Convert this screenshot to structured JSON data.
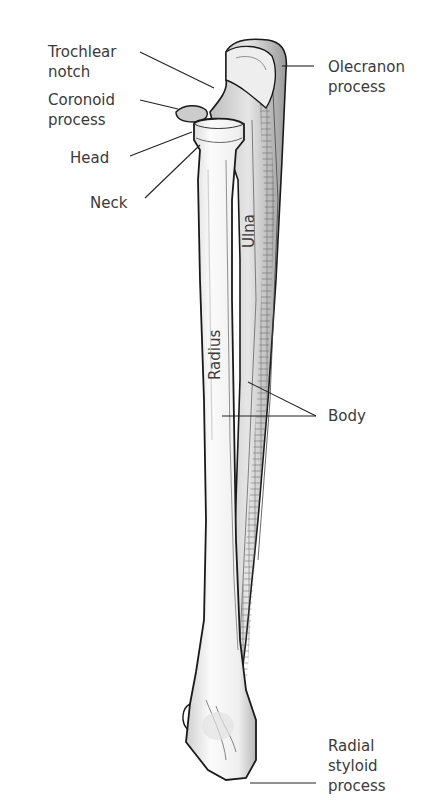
{
  "diagram": {
    "bone_labels": {
      "radius": "Radius",
      "ulna": "Ulna"
    },
    "callouts": [
      {
        "id": "trochlear-notch",
        "text": "Trochlear\nnotch"
      },
      {
        "id": "coronoid-process",
        "text": "Coronoid\nprocess"
      },
      {
        "id": "head",
        "text": "Head"
      },
      {
        "id": "neck",
        "text": "Neck"
      },
      {
        "id": "olecranon-process",
        "text": "Olecranon\nprocess"
      },
      {
        "id": "body",
        "text": "Body"
      },
      {
        "id": "radial-styloid-process",
        "text": "Radial\nstyloid\nprocess"
      }
    ],
    "colors": {
      "bone_fill": "#f4f4f4",
      "bone_shade": "#c8c8c8",
      "outline": "#1a1a1a",
      "leader_line": "#222222",
      "text": "#3a3a3a"
    }
  }
}
